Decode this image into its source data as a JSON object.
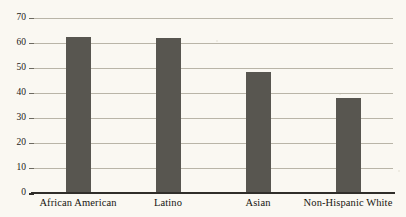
{
  "chart_data": {
    "type": "bar",
    "title": "",
    "subtitle": "",
    "xlabel": "",
    "ylabel": "",
    "categories": [
      "African American",
      "Latino",
      "Asian",
      "Non-Hispanic White"
    ],
    "values": [
      62.4,
      62,
      48.5,
      38
    ],
    "series": [
      {
        "name": "",
        "values": [
          62.4,
          62,
          48.5,
          38
        ]
      }
    ],
    "ylim": [
      0,
      70
    ],
    "xlim": [
      0,
      4
    ],
    "ytick_labels": [
      "0",
      "10",
      "20",
      "30",
      "40",
      "50",
      "60",
      "70"
    ],
    "ytick_values": [
      0,
      10,
      20,
      30,
      40,
      50,
      60,
      70
    ],
    "grid": "horizontal",
    "legend": "none",
    "annotations": [],
    "colors": {
      "bar": "#585650",
      "background": "#faf8f2",
      "gridline": "#b9b5a8",
      "axis": "#302e2a",
      "text": "#1b1a17"
    }
  }
}
